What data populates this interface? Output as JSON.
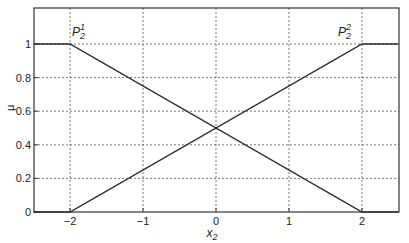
{
  "chart_data": {
    "type": "line",
    "title": "",
    "xlabel": "x",
    "xlabel_sub": "2",
    "ylabel": "μ",
    "xlim": [
      -2.5,
      2.5
    ],
    "ylim": [
      0,
      1.15
    ],
    "grid": true,
    "x_ticks": [
      -2,
      -1,
      0,
      1,
      2
    ],
    "x_tick_labels": [
      "−2",
      "−1",
      "0",
      "1",
      "2"
    ],
    "y_ticks": [
      0,
      0.2,
      0.4,
      0.6,
      0.8,
      1
    ],
    "y_tick_labels": [
      "0",
      "0.2",
      "0.4",
      "0.6",
      "0.8",
      "1"
    ],
    "series": [
      {
        "name": "P2^1",
        "x": [
          -2.5,
          -2,
          2,
          2.5
        ],
        "y": [
          1,
          1,
          0,
          0
        ]
      },
      {
        "name": "P2^2",
        "x": [
          -2.5,
          -2,
          2,
          2.5
        ],
        "y": [
          0,
          0,
          1,
          1
        ]
      }
    ],
    "annotations": [
      {
        "text": "P",
        "sup": "1",
        "sub": "2",
        "x": -2,
        "y": 1
      },
      {
        "text": "P",
        "sup": "2",
        "sub": "2",
        "x": 2,
        "y": 1
      }
    ]
  }
}
